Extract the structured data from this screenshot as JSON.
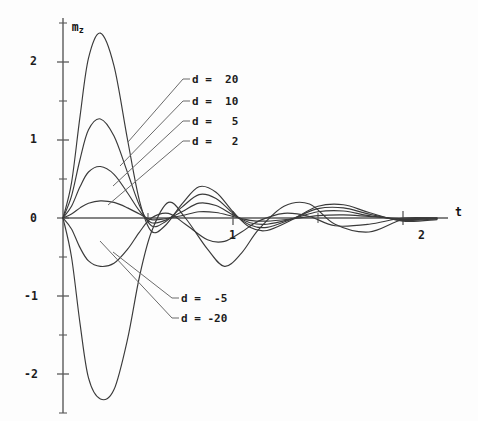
{
  "figure": {
    "background": "#fdfdfd",
    "curve_color": "#3a3a3a",
    "axis_color": "#5a5a5a"
  },
  "axes": {
    "y_axis_name": "m",
    "y_axis_subscript": "z",
    "x_axis_name": "t",
    "y_tick_labels": [
      "2",
      "1",
      "0",
      "-1",
      "-2"
    ],
    "y_tick_values": [
      2,
      1,
      0,
      -1,
      -2
    ],
    "x_tick_labels": [
      "1",
      "2"
    ],
    "x_tick_values": [
      1,
      2
    ]
  },
  "legend": {
    "positive": [
      {
        "name": "legend-d-20",
        "label": "d =  20",
        "d": 20
      },
      {
        "name": "legend-d-10",
        "label": "d =  10",
        "d": 10
      },
      {
        "name": "legend-d-5",
        "label": "d =   5",
        "d": 5
      },
      {
        "name": "legend-d-2",
        "label": "d =   2",
        "d": 2
      }
    ],
    "negative": [
      {
        "name": "legend-d-neg5",
        "label": "d =  -5",
        "d": -5
      },
      {
        "name": "legend-d-neg20",
        "label": "d = -20",
        "d": -20
      }
    ]
  },
  "chart_data": {
    "type": "line",
    "title": "",
    "xlabel": "t",
    "ylabel": "m_z",
    "xlim": [
      0,
      2.3
    ],
    "ylim": [
      -2.5,
      2.55
    ],
    "grid": false,
    "legend_position": "inline-annotations",
    "x_ticks_major": [
      0,
      1,
      2
    ],
    "x_ticks_minor": [
      0.5,
      1.5
    ],
    "y_ticks_major": [
      -2,
      -1,
      0,
      1,
      2
    ],
    "y_ticks_minor": [
      -2.5,
      -1.5,
      -0.5,
      0.5,
      1.5,
      2.5
    ],
    "series": [
      {
        "name": "d = 20",
        "d": 20,
        "amplitude": 2.37,
        "first_peak": {
          "t": 0.22,
          "m_z": 2.37
        },
        "first_trough": {
          "t": 0.52,
          "m_z": -0.17
        },
        "second_peak": {
          "t": 0.8,
          "m_z": 0.4
        },
        "points_t": [
          0.0,
          0.05,
          0.1,
          0.15,
          0.22,
          0.3,
          0.38,
          0.45,
          0.52,
          0.6,
          0.7,
          0.8,
          0.9,
          1.0,
          1.1,
          1.2,
          1.35,
          1.5,
          1.65,
          1.8,
          2.0,
          2.2
        ],
        "points_mz": [
          0.0,
          0.45,
          1.3,
          2.05,
          2.37,
          1.95,
          1.0,
          0.22,
          -0.17,
          -0.1,
          0.18,
          0.4,
          0.33,
          0.08,
          -0.12,
          -0.16,
          -0.02,
          0.15,
          0.17,
          0.07,
          -0.04,
          -0.02
        ]
      },
      {
        "name": "d = 10",
        "d": 10,
        "amplitude": 1.27,
        "first_peak": {
          "t": 0.22,
          "m_z": 1.27
        },
        "first_trough": {
          "t": 0.52,
          "m_z": -0.1
        },
        "second_peak": {
          "t": 0.8,
          "m_z": 0.3
        },
        "points_t": [
          0.0,
          0.05,
          0.1,
          0.15,
          0.22,
          0.3,
          0.38,
          0.45,
          0.52,
          0.6,
          0.7,
          0.8,
          0.9,
          1.0,
          1.1,
          1.2,
          1.35,
          1.5,
          1.65,
          1.8,
          2.0,
          2.2
        ],
        "points_mz": [
          0.0,
          0.28,
          0.75,
          1.13,
          1.27,
          1.05,
          0.58,
          0.16,
          -0.1,
          -0.05,
          0.14,
          0.3,
          0.25,
          0.06,
          -0.09,
          -0.12,
          -0.01,
          0.12,
          0.13,
          0.05,
          -0.03,
          -0.01
        ]
      },
      {
        "name": "d = 5",
        "d": 5,
        "amplitude": 0.66,
        "first_peak": {
          "t": 0.22,
          "m_z": 0.66
        },
        "first_trough": {
          "t": 0.52,
          "m_z": -0.06
        },
        "second_peak": {
          "t": 0.8,
          "m_z": 0.19
        },
        "points_t": [
          0.0,
          0.05,
          0.1,
          0.15,
          0.22,
          0.3,
          0.38,
          0.45,
          0.52,
          0.6,
          0.7,
          0.8,
          0.9,
          1.0,
          1.1,
          1.2,
          1.35,
          1.5,
          1.65,
          1.8,
          2.0,
          2.2
        ],
        "points_mz": [
          0.0,
          0.15,
          0.4,
          0.59,
          0.66,
          0.56,
          0.32,
          0.09,
          -0.06,
          -0.03,
          0.08,
          0.19,
          0.16,
          0.04,
          -0.06,
          -0.08,
          -0.01,
          0.08,
          0.09,
          0.03,
          -0.02,
          -0.01
        ]
      },
      {
        "name": "d = 2",
        "d": 2,
        "amplitude": 0.22,
        "first_peak": {
          "t": 0.25,
          "m_z": 0.22
        },
        "first_trough": {
          "t": 0.55,
          "m_z": -0.03
        },
        "second_peak": {
          "t": 0.82,
          "m_z": 0.08
        },
        "points_t": [
          0.0,
          0.05,
          0.1,
          0.15,
          0.22,
          0.3,
          0.38,
          0.45,
          0.52,
          0.6,
          0.7,
          0.8,
          0.9,
          1.0,
          1.1,
          1.2,
          1.35,
          1.5,
          1.65,
          1.8,
          2.0,
          2.2
        ],
        "points_mz": [
          0.0,
          0.05,
          0.13,
          0.19,
          0.22,
          0.2,
          0.13,
          0.05,
          -0.02,
          -0.01,
          0.03,
          0.08,
          0.07,
          0.02,
          -0.03,
          -0.04,
          -0.01,
          0.03,
          0.04,
          0.02,
          -0.01,
          0.0
        ]
      },
      {
        "name": "d = -5",
        "d": -5,
        "amplitude": -0.66,
        "first_peak": {
          "t": 0.26,
          "m_z": -0.62
        },
        "first_trough": {
          "t": 0.56,
          "m_z": 0.06
        },
        "second_peak": {
          "t": 0.85,
          "m_z": -0.28
        },
        "points_t": [
          0.0,
          0.05,
          0.1,
          0.15,
          0.22,
          0.3,
          0.38,
          0.45,
          0.52,
          0.62,
          0.72,
          0.85,
          0.95,
          1.05,
          1.15,
          1.3,
          1.45,
          1.6,
          1.8,
          2.0,
          2.2
        ],
        "points_mz": [
          0.0,
          -0.14,
          -0.38,
          -0.55,
          -0.62,
          -0.58,
          -0.4,
          -0.18,
          0.0,
          0.06,
          -0.08,
          -0.28,
          -0.3,
          -0.18,
          -0.04,
          0.06,
          0.02,
          -0.1,
          -0.08,
          0.0,
          0.0
        ]
      },
      {
        "name": "d = -20",
        "d": -20,
        "amplitude": -2.32,
        "first_peak": {
          "t": 0.25,
          "m_z": -2.32
        },
        "first_trough": {
          "t": 0.58,
          "m_z": 0.22
        },
        "second_peak": {
          "t": 0.88,
          "m_z": -0.62
        },
        "points_t": [
          0.0,
          0.05,
          0.1,
          0.15,
          0.22,
          0.3,
          0.38,
          0.45,
          0.52,
          0.62,
          0.72,
          0.85,
          0.95,
          1.05,
          1.15,
          1.3,
          1.45,
          1.6,
          1.8,
          2.0,
          2.2
        ],
        "points_mz": [
          0.0,
          -0.5,
          -1.35,
          -2.05,
          -2.32,
          -2.2,
          -1.55,
          -0.75,
          -0.18,
          0.2,
          0.0,
          -0.4,
          -0.62,
          -0.45,
          -0.15,
          0.15,
          0.18,
          -0.08,
          -0.18,
          -0.02,
          0.0
        ]
      }
    ]
  }
}
